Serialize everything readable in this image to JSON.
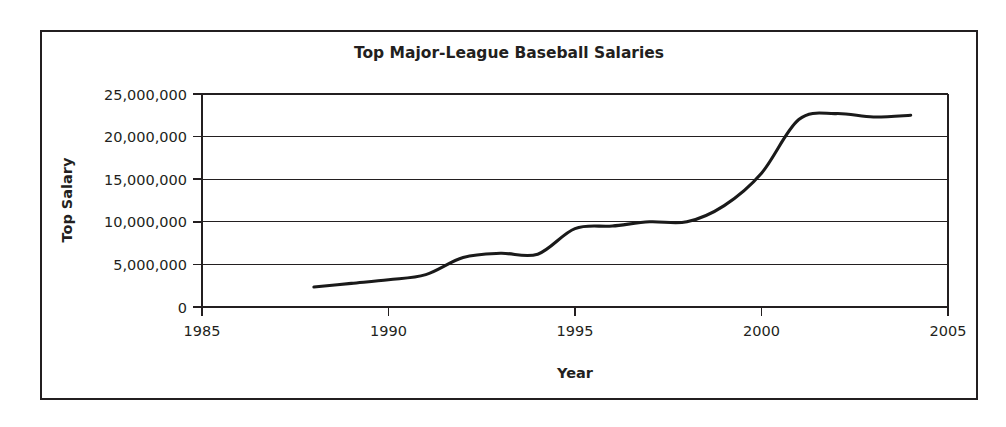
{
  "chart_data": {
    "type": "line",
    "title": "Top Major-League Baseball Salaries",
    "xlabel": "Year",
    "ylabel": "Top Salary",
    "xlim": [
      1985,
      2005
    ],
    "ylim": [
      0,
      25000000
    ],
    "grid": true,
    "legend": false,
    "x_ticks": [
      "1985",
      "1990",
      "1995",
      "2000",
      "2005"
    ],
    "x_tick_values": [
      1985,
      1990,
      1995,
      2000,
      2005
    ],
    "y_ticks": [
      "0",
      "5,000,000",
      "10,000,000",
      "15,000,000",
      "20,000,000",
      "25,000,000"
    ],
    "y_tick_values": [
      0,
      5000000,
      10000000,
      15000000,
      20000000,
      25000000
    ],
    "series": [
      {
        "name": "Top Salary",
        "x": [
          1988,
          1989,
          1990,
          1991,
          1992,
          1993,
          1994,
          1995,
          1996,
          1997,
          1998,
          1999,
          2000,
          2001,
          2002,
          2003,
          2004
        ],
        "values": [
          2340000,
          2770000,
          3200000,
          3800000,
          5800000,
          6300000,
          6200000,
          9200000,
          9500000,
          10000000,
          10000000,
          11900000,
          15700000,
          22000000,
          22700000,
          22300000,
          22500000
        ]
      }
    ]
  },
  "labels": {
    "title": "Top Major-League Baseball Salaries",
    "y_axis_title": "Top Salary",
    "x_axis_title": "Year"
  }
}
